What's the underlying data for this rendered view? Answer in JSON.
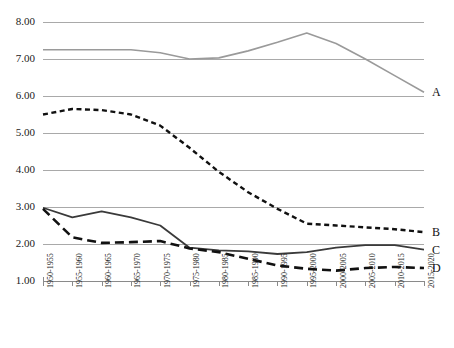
{
  "chart_data": {
    "type": "line",
    "title": "",
    "subtitle": "",
    "xlabel": "",
    "ylabel": "",
    "ylim": [
      1.0,
      8.0
    ],
    "ytick_step": 1.0,
    "grid": true,
    "legend_position": "right-end-labels",
    "categories": [
      "1950-1955",
      "1955-1960",
      "1960-1965",
      "1965-1970",
      "1970-1975",
      "1975-1980",
      "1980-1985",
      "1985-1990",
      "1990-1995",
      "1995-2000",
      "2000-2005",
      "2005-2010",
      "2010-2015",
      "2015-2020"
    ],
    "ytick_labels": [
      "8.00",
      "7.00",
      "6.00",
      "5.00",
      "4.00",
      "3.00",
      "2.00",
      "1.00"
    ],
    "ytick_values": [
      8.0,
      7.0,
      6.0,
      5.0,
      4.0,
      3.0,
      2.0,
      1.0
    ],
    "series": [
      {
        "name": "A",
        "label": "A",
        "color": "#9a9a9a",
        "style": "solid",
        "width": 1.6,
        "values": [
          7.25,
          7.25,
          7.25,
          7.25,
          7.17,
          7.0,
          7.03,
          7.22,
          7.45,
          7.7,
          7.42,
          7.0,
          6.55,
          6.1
        ]
      },
      {
        "name": "B",
        "label": "B",
        "color": "#111111",
        "style": "short-dash",
        "width": 2.4,
        "values": [
          5.5,
          5.65,
          5.62,
          5.5,
          5.2,
          4.6,
          3.95,
          3.4,
          2.95,
          2.55,
          2.5,
          2.45,
          2.4,
          2.32
        ]
      },
      {
        "name": "C",
        "label": "C",
        "color": "#3a3a3a",
        "style": "solid",
        "width": 1.8,
        "values": [
          2.98,
          2.72,
          2.88,
          2.72,
          2.5,
          1.9,
          1.83,
          1.8,
          1.73,
          1.78,
          1.9,
          1.97,
          1.97,
          1.85
        ]
      },
      {
        "name": "D",
        "label": "D",
        "color": "#111111",
        "style": "long-dash",
        "width": 2.6,
        "values": [
          2.95,
          2.18,
          2.03,
          2.05,
          2.08,
          1.88,
          1.78,
          1.6,
          1.42,
          1.33,
          1.28,
          1.35,
          1.38,
          1.35
        ]
      }
    ]
  },
  "colors": {
    "gridline": "#a9a9a9",
    "axis": "#8a8a8a",
    "text": "#222222",
    "background": "#ffffff"
  },
  "geometry": {
    "plot_left": 43,
    "plot_right": 424,
    "plot_top": 22,
    "plot_bottom": 281
  }
}
